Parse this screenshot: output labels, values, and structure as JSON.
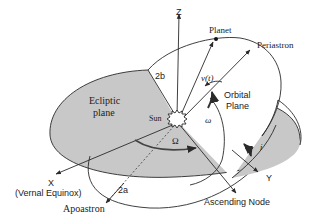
{
  "diagram": {
    "type": "orbital-elements",
    "colors": {
      "ecliptic_fill": "#c8c8c8",
      "orbital_fill": "#ffffff",
      "line": "#2a2a2a",
      "background": "#ffffff"
    },
    "labels": {
      "z_axis": "Z",
      "planet": "Planet",
      "periastron": "Periastron",
      "semi_minor": "2b",
      "true_anomaly": "ν(t)",
      "orbital_plane_line1": "Orbital",
      "orbital_plane_line2": "Plane",
      "ecliptic_line1": "Ecliptic",
      "ecliptic_line2": "plane",
      "sun": "Sun",
      "arg_periastron": "ω",
      "long_asc_node": "Ω",
      "inclination": "i",
      "y_axis": "Y",
      "x_axis": "X",
      "vernal_equinox": "(Vernal Equinox)",
      "semi_major": "2a",
      "apoastron": "Apoastron",
      "ascending_node": "Ascending Node"
    }
  }
}
